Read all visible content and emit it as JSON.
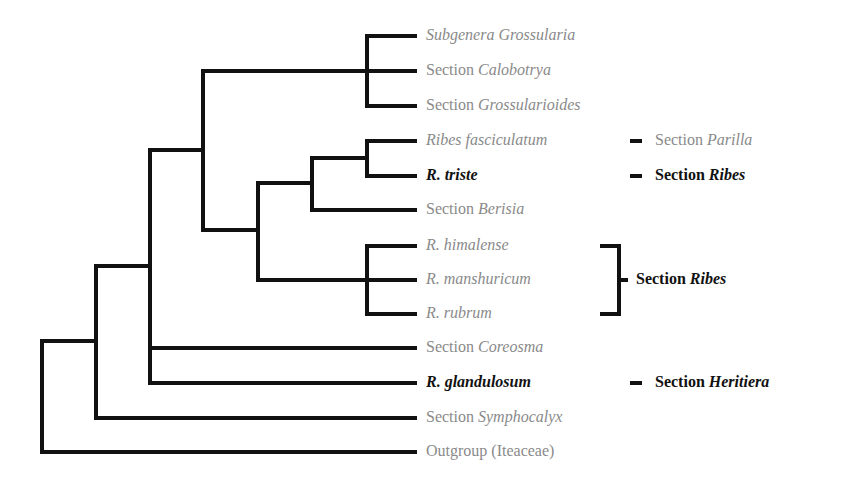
{
  "taxa": [
    {
      "prefix": "",
      "italic": "Subgenera Grossularia",
      "y": 36,
      "highlight": false
    },
    {
      "prefix": "Section ",
      "italic": "Calobotrya",
      "y": 71,
      "highlight": false
    },
    {
      "prefix": "Section ",
      "italic": "Grossularioides",
      "y": 106,
      "highlight": false
    },
    {
      "prefix": "",
      "italic": "Ribes fasciculatum",
      "y": 141,
      "highlight": false
    },
    {
      "prefix": "",
      "italic": "R. triste",
      "y": 176,
      "highlight": true
    },
    {
      "prefix": "Section ",
      "italic": "Berisia",
      "y": 210,
      "highlight": false
    },
    {
      "prefix": "",
      "italic": "R. himalense",
      "y": 246,
      "highlight": false
    },
    {
      "prefix": "",
      "italic": "R. manshuricum",
      "y": 280,
      "highlight": false
    },
    {
      "prefix": "",
      "italic": "R. rubrum",
      "y": 314,
      "highlight": false
    },
    {
      "prefix": "Section ",
      "italic": "Coreosma",
      "y": 348,
      "highlight": false
    },
    {
      "prefix": "",
      "italic": "R. glandulosum",
      "y": 383,
      "highlight": true
    },
    {
      "prefix": "Section ",
      "italic": "Symphocalyx",
      "y": 418,
      "highlight": false
    },
    {
      "prefix": "Outgroup (Iteaceae)",
      "italic": "",
      "y": 452,
      "highlight": false
    }
  ],
  "sections": [
    {
      "prefix": "Section ",
      "italic": "Parilla",
      "y": 141,
      "style": "gray"
    },
    {
      "prefix": "Section ",
      "italic": "Ribes",
      "y": 176,
      "style": "dark"
    },
    {
      "prefix": "Section ",
      "italic": "Ribes",
      "y": 280,
      "style": "dark",
      "bracket": true
    },
    {
      "prefix": "Section ",
      "italic": "Heritiera",
      "y": 383,
      "style": "dark"
    }
  ],
  "line_color": "#111111",
  "label_color": "#8a8a8a"
}
